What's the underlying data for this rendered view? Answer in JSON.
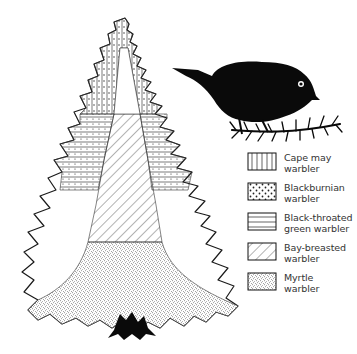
{
  "figure": {
    "bird_silhouette": "warbler perched on spruce branch"
  },
  "legend": {
    "items": [
      {
        "line1": "Cape may",
        "line2": "warbler",
        "pattern": "vertical-lines"
      },
      {
        "line1": "Blackburnian",
        "line2": "warbler",
        "pattern": "dots"
      },
      {
        "line1": "Black-throated",
        "line2": "green warbler",
        "pattern": "horizontal-lines"
      },
      {
        "line1": "Bay-breasted",
        "line2": "warbler",
        "pattern": "diagonal-lines"
      },
      {
        "line1": "Myrtle",
        "line2": "warbler",
        "pattern": "stipple"
      }
    ]
  },
  "colors": {
    "ink": "#111111",
    "background": "#ffffff"
  }
}
